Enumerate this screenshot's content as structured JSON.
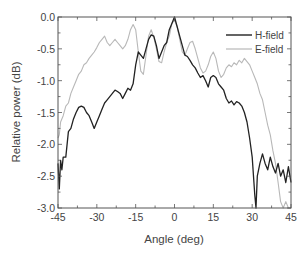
{
  "chart_data": {
    "type": "line",
    "title": "",
    "xlabel": "Angle (deg)",
    "ylabel": "Relative power (dB)",
    "xlim": [
      -45,
      45
    ],
    "ylim": [
      -3.0,
      0.0
    ],
    "xticks": [
      -45,
      -30,
      -15,
      0,
      15,
      30,
      45
    ],
    "yticks": [
      0.0,
      -0.5,
      -1.0,
      -1.5,
      -2.0,
      -2.5,
      -3.0
    ],
    "xtick_labels": [
      "-45",
      "-30",
      "-15",
      "0",
      "15",
      "30",
      "45"
    ],
    "ytick_labels": [
      "0.0",
      "-0.5",
      "-1.0",
      "-1.5",
      "-2.0",
      "-2.5",
      "-3.0"
    ],
    "grid": false,
    "legend_position": "upper right",
    "series": [
      {
        "name": "H-field",
        "color": "#222222",
        "x": [
          -45,
          -44.5,
          -44,
          -43.5,
          -43,
          -42,
          -41,
          -40,
          -39,
          -38,
          -37,
          -36,
          -35,
          -34,
          -33,
          -32,
          -31,
          -30,
          -29,
          -28,
          -27,
          -26,
          -25,
          -24,
          -23,
          -22,
          -21,
          -20,
          -19,
          -18,
          -17,
          -16,
          -15,
          -14,
          -13,
          -12,
          -11,
          -10,
          -9,
          -8,
          -7,
          -6,
          -5,
          -4,
          -3,
          -2,
          -1,
          0,
          1,
          2,
          3,
          4,
          5,
          6,
          7,
          8,
          9,
          10,
          11,
          12,
          13,
          14,
          15,
          16,
          17,
          18,
          19,
          20,
          21,
          22,
          23,
          24,
          25,
          26,
          27,
          28,
          29,
          30,
          30.5,
          31,
          31.5,
          32,
          33,
          34,
          35,
          36,
          37,
          38,
          39,
          40,
          41,
          42,
          43,
          44,
          45
        ],
        "y": [
          -2.3,
          -2.7,
          -2.25,
          -2.4,
          -2.2,
          -2.2,
          -1.8,
          -1.75,
          -1.6,
          -1.5,
          -1.42,
          -1.4,
          -1.42,
          -1.5,
          -1.55,
          -1.65,
          -1.75,
          -1.65,
          -1.55,
          -1.45,
          -1.35,
          -1.3,
          -1.25,
          -1.2,
          -1.15,
          -1.17,
          -1.2,
          -1.28,
          -1.2,
          -1.12,
          -1.15,
          -1.05,
          -0.75,
          -0.55,
          -0.6,
          -0.65,
          -0.5,
          -0.35,
          -0.28,
          -0.3,
          -0.45,
          -0.65,
          -0.55,
          -0.45,
          -0.4,
          -0.2,
          -0.1,
          0.0,
          -0.15,
          -0.3,
          -0.45,
          -0.6,
          -0.62,
          -0.68,
          -0.75,
          -0.8,
          -0.88,
          -0.95,
          -0.92,
          -1.0,
          -1.1,
          -0.95,
          -0.92,
          -0.95,
          -1.05,
          -1.1,
          -1.15,
          -1.28,
          -1.35,
          -1.32,
          -1.38,
          -1.33,
          -1.35,
          -1.4,
          -1.5,
          -1.65,
          -1.9,
          -2.2,
          -2.5,
          -2.8,
          -3.0,
          -2.5,
          -2.3,
          -2.15,
          -2.3,
          -2.4,
          -2.2,
          -2.35,
          -2.45,
          -2.3,
          -2.5,
          -2.4,
          -2.6,
          -2.35,
          -2.6
        ]
      },
      {
        "name": "E-field",
        "color": "#b8b8b8",
        "x": [
          -45,
          -44.5,
          -44,
          -43,
          -42,
          -41,
          -40,
          -39,
          -38,
          -37,
          -36,
          -35,
          -34,
          -33,
          -32,
          -31,
          -30,
          -29,
          -28,
          -27,
          -26,
          -25,
          -24,
          -23,
          -22,
          -21,
          -20,
          -19,
          -18,
          -17,
          -16,
          -15,
          -14,
          -13,
          -12,
          -11,
          -10,
          -9,
          -8,
          -7,
          -6,
          -5,
          -4,
          -3,
          -2,
          -1,
          0,
          1,
          2,
          3,
          4,
          5,
          6,
          7,
          8,
          9,
          10,
          11,
          12,
          13,
          14,
          15,
          16,
          17,
          18,
          19,
          20,
          21,
          22,
          23,
          24,
          25,
          26,
          27,
          28,
          29,
          30,
          31,
          32,
          33,
          34,
          35,
          36,
          37,
          38,
          39,
          40,
          41,
          42,
          43,
          44,
          45
        ],
        "y": [
          -1.9,
          -1.85,
          -1.65,
          -1.55,
          -1.4,
          -1.35,
          -1.2,
          -1.1,
          -1.0,
          -0.9,
          -0.85,
          -0.75,
          -0.72,
          -0.65,
          -0.6,
          -0.55,
          -0.48,
          -0.4,
          -0.35,
          -0.3,
          -0.4,
          -0.45,
          -0.4,
          -0.35,
          -0.4,
          -0.45,
          -0.5,
          -0.45,
          -0.35,
          -0.2,
          -0.12,
          -0.2,
          -0.55,
          -0.85,
          -0.9,
          -0.6,
          -0.3,
          -0.2,
          -0.32,
          -0.5,
          -0.7,
          -0.72,
          -0.55,
          -0.4,
          -0.3,
          -0.1,
          -0.05,
          -0.15,
          -0.35,
          -0.55,
          -0.6,
          -0.5,
          -0.4,
          -0.38,
          -0.5,
          -0.65,
          -0.8,
          -0.88,
          -0.85,
          -0.75,
          -0.62,
          -0.55,
          -0.65,
          -0.85,
          -0.95,
          -0.9,
          -0.8,
          -0.75,
          -0.78,
          -0.72,
          -0.75,
          -0.68,
          -0.72,
          -0.65,
          -0.7,
          -0.75,
          -0.85,
          -0.95,
          -1.05,
          -1.2,
          -1.3,
          -1.5,
          -1.7,
          -1.85,
          -2.1,
          -2.3,
          -2.6,
          -2.9,
          -3.0,
          -2.9,
          -3.0,
          -3.0
        ]
      }
    ]
  }
}
